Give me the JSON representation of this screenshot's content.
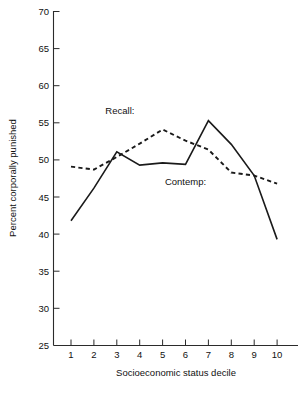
{
  "chart_data": {
    "type": "line",
    "title": "",
    "subtitle": "",
    "xlabel": "Socioeconomic status decile",
    "ylabel": "Percent corporally punished",
    "categories": [
      "1",
      "2",
      "3",
      "4",
      "5",
      "6",
      "7",
      "8",
      "9",
      "10"
    ],
    "x": [
      1,
      2,
      3,
      4,
      5,
      6,
      7,
      8,
      9,
      10
    ],
    "xlim": [
      1,
      10
    ],
    "ylim": [
      25,
      70
    ],
    "yticks": [
      25,
      30,
      35,
      40,
      45,
      50,
      55,
      60,
      65,
      70
    ],
    "ytick_labels": [
      "25",
      "30",
      "35",
      "40",
      "45",
      "50",
      "55",
      "60",
      "65",
      "70"
    ],
    "grid": false,
    "legend_position": "inline-annotations",
    "series": [
      {
        "name": "Contemp:",
        "style": "solid",
        "values": [
          41.8,
          46.2,
          51.1,
          49.3,
          49.6,
          49.4,
          55.3,
          52.1,
          47.9,
          39.3
        ]
      },
      {
        "name": "Recall:",
        "style": "dashed",
        "values": [
          49.1,
          48.7,
          50.4,
          52.2,
          54.1,
          52.6,
          51.4,
          48.3,
          47.9,
          46.8
        ]
      }
    ],
    "annotations": [
      {
        "text": "Recall:",
        "x": 2.5,
        "y": 56.2
      },
      {
        "text": "Contemp:",
        "x": 5.1,
        "y": 46.6
      }
    ]
  }
}
